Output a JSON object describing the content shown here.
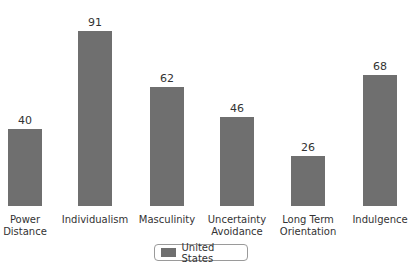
{
  "chart_data": {
    "type": "bar",
    "title": "",
    "xlabel": "",
    "ylabel": "",
    "categories": [
      "Power Distance",
      "Individualism",
      "Masculinity",
      "Uncertainty Avoidance",
      "Long Term Orientation",
      "Indulgence"
    ],
    "category_lines": [
      [
        "Power",
        "Distance"
      ],
      [
        "Individualism",
        ""
      ],
      [
        "Masculinity",
        ""
      ],
      [
        "Uncertainty",
        "Avoidance"
      ],
      [
        "Long Term",
        "Orientation"
      ],
      [
        "Indulgence",
        ""
      ]
    ],
    "series": [
      {
        "name": "United States",
        "color": "#6f6f6f",
        "values": [
          40,
          91,
          62,
          46,
          26,
          68
        ]
      }
    ],
    "value_labels": [
      "40",
      "91",
      "62",
      "46",
      "26",
      "68"
    ],
    "ylim": [
      0,
      100
    ],
    "grid": false,
    "legend_position": "bottom-center"
  },
  "legend": {
    "label": "United States"
  }
}
